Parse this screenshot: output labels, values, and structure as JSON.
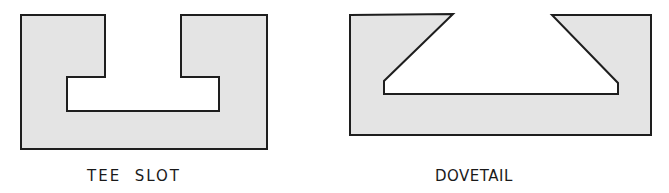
{
  "colors": {
    "fill": "#e4e4e4",
    "stroke": "#1e1e1e",
    "background": "#ffffff",
    "text": "#1a1a1a"
  },
  "figures": [
    {
      "id": "tee-slot",
      "label": "TEE  SLOT",
      "outline_points": "21,15 105,15 105,77 67,77 67,111 219,111 219,77 181,77 181,15 267,15 267,149 21,149"
    },
    {
      "id": "dovetail",
      "label": "DOVETAIL",
      "outline_points": "350,15 453,14 384,81 384,94 618,94 618,83 552,15 651,15 651,135 350,135"
    }
  ]
}
